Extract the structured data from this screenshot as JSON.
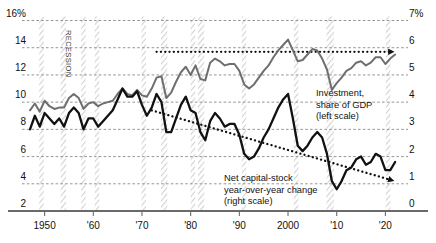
{
  "chart_data": {
    "type": "line",
    "title": "",
    "xlabel": "",
    "ylabel": "",
    "x_ticks": [
      "1950",
      "'60",
      "'70",
      "'80",
      "'90",
      "2000",
      "'10",
      "'20"
    ],
    "x_tick_years": [
      1950,
      1960,
      1970,
      1980,
      1990,
      2000,
      2010,
      2020
    ],
    "xlim": [
      1947,
      2023
    ],
    "left_axis": {
      "label": "16%",
      "unit": "%",
      "ticks": [
        "2",
        "4",
        "6",
        "8",
        "10",
        "12",
        "14",
        "16%"
      ],
      "tick_values": [
        2,
        4,
        6,
        8,
        10,
        12,
        14,
        16
      ],
      "ylim": [
        2,
        16
      ],
      "scale_note": "left scale"
    },
    "right_axis": {
      "label": "7%",
      "unit": "%",
      "ticks": [
        "0",
        "1",
        "2",
        "3",
        "4",
        "5",
        "6",
        "7%"
      ],
      "tick_values": [
        0,
        1,
        2,
        3,
        4,
        5,
        6,
        7
      ],
      "ylim": [
        0,
        7
      ],
      "scale_note": "right scale"
    },
    "grid": true,
    "legend_position": "inline-annotations",
    "series": [
      {
        "name": "Investment, share of GDP",
        "axis": "left",
        "color": "#6e6e6e",
        "style": "solid",
        "x": [
          1947,
          1948,
          1949,
          1950,
          1951,
          1952,
          1953,
          1954,
          1955,
          1956,
          1957,
          1958,
          1959,
          1960,
          1961,
          1962,
          1963,
          1964,
          1965,
          1966,
          1967,
          1968,
          1969,
          1970,
          1971,
          1972,
          1973,
          1974,
          1975,
          1976,
          1977,
          1978,
          1979,
          1980,
          1981,
          1982,
          1983,
          1984,
          1985,
          1986,
          1987,
          1988,
          1989,
          1990,
          1991,
          1992,
          1993,
          1994,
          1995,
          1996,
          1997,
          1998,
          1999,
          2000,
          2001,
          2002,
          2003,
          2004,
          2005,
          2006,
          2007,
          2008,
          2009,
          2010,
          2011,
          2012,
          2013,
          2014,
          2015,
          2016,
          2017,
          2018,
          2019,
          2020,
          2021,
          2022
        ],
        "values": [
          9.4,
          9.9,
          9.3,
          10.1,
          9.7,
          9.5,
          9.6,
          9.6,
          10.3,
          10.6,
          10.3,
          9.5,
          9.9,
          10.0,
          9.7,
          9.9,
          10.0,
          10.1,
          10.6,
          11.0,
          10.6,
          10.5,
          10.9,
          10.5,
          10.4,
          11.0,
          11.8,
          11.9,
          10.3,
          10.7,
          11.5,
          12.2,
          12.6,
          12.0,
          12.7,
          11.7,
          11.6,
          12.9,
          13.2,
          13.0,
          12.7,
          12.8,
          12.8,
          12.3,
          11.3,
          11.0,
          11.3,
          11.8,
          12.3,
          12.7,
          13.3,
          13.8,
          14.2,
          14.6,
          13.8,
          13.0,
          13.1,
          13.5,
          13.9,
          13.8,
          13.2,
          12.4,
          10.9,
          11.4,
          11.8,
          12.3,
          12.5,
          12.9,
          13.0,
          12.7,
          12.9,
          13.3,
          13.3,
          12.8,
          13.2,
          13.5
        ]
      },
      {
        "name": "Net capital-stock year-over-year change",
        "axis": "right",
        "color": "#111111",
        "style": "solid",
        "x": [
          1947,
          1948,
          1949,
          1950,
          1951,
          1952,
          1953,
          1954,
          1955,
          1956,
          1957,
          1958,
          1959,
          1960,
          1961,
          1962,
          1963,
          1964,
          1965,
          1966,
          1967,
          1968,
          1969,
          1970,
          1971,
          1972,
          1973,
          1974,
          1975,
          1976,
          1977,
          1978,
          1979,
          1980,
          1981,
          1982,
          1983,
          1984,
          1985,
          1986,
          1987,
          1988,
          1989,
          1990,
          1991,
          1992,
          1993,
          1994,
          1995,
          1996,
          1997,
          1998,
          1999,
          2000,
          2001,
          2002,
          2003,
          2004,
          2005,
          2006,
          2007,
          2008,
          2009,
          2010,
          2011,
          2012,
          2013,
          2014,
          2015,
          2016,
          2017,
          2018,
          2019,
          2020,
          2021,
          2022
        ],
        "values": [
          3.0,
          3.5,
          3.1,
          3.6,
          3.4,
          3.2,
          3.4,
          3.1,
          3.6,
          3.8,
          3.6,
          3.0,
          3.4,
          3.4,
          3.1,
          3.3,
          3.5,
          3.7,
          4.1,
          4.5,
          4.2,
          4.2,
          4.4,
          3.9,
          3.5,
          3.8,
          4.3,
          4.0,
          2.9,
          2.9,
          3.4,
          3.9,
          4.2,
          3.7,
          3.6,
          2.9,
          2.6,
          3.3,
          3.6,
          3.4,
          3.1,
          3.2,
          3.2,
          2.8,
          2.1,
          1.9,
          2.0,
          2.3,
          2.7,
          3.0,
          3.4,
          3.8,
          4.1,
          4.3,
          3.4,
          2.4,
          2.2,
          2.4,
          2.7,
          2.9,
          2.7,
          2.1,
          1.1,
          0.8,
          1.1,
          1.5,
          1.6,
          1.9,
          2.0,
          1.7,
          1.8,
          2.1,
          2.0,
          1.5,
          1.5,
          1.8
        ]
      }
    ],
    "trend_annotations": [
      {
        "name": "investment-trend-arrow",
        "axis": "left",
        "style": "dotted-arrow",
        "from": {
          "year": 1973,
          "value": 13.7
        },
        "to": {
          "year": 2022,
          "value": 13.7
        },
        "direction": "flat"
      },
      {
        "name": "netcap-trend-arrow",
        "axis": "right",
        "style": "dotted-arrow",
        "from": {
          "year": 1972,
          "value": 3.7
        },
        "to": {
          "year": 2022,
          "value": 1.15
        },
        "direction": "declining"
      }
    ],
    "recession_bands": [
      {
        "start": 1948.9,
        "end": 1949.8
      },
      {
        "start": 1953.3,
        "end": 1954.4
      },
      {
        "start": 1957.5,
        "end": 1958.3
      },
      {
        "start": 1960.3,
        "end": 1961.1
      },
      {
        "start": 1969.9,
        "end": 1970.8
      },
      {
        "start": 1973.9,
        "end": 1975.2
      },
      {
        "start": 1980.0,
        "end": 1980.5
      },
      {
        "start": 1981.5,
        "end": 1982.8
      },
      {
        "start": 1990.5,
        "end": 1991.2
      },
      {
        "start": 2001.2,
        "end": 2001.9
      },
      {
        "start": 2007.9,
        "end": 2009.4
      },
      {
        "start": 2020.1,
        "end": 2020.5
      }
    ]
  },
  "labels": {
    "recession_band_label": "RECESSION",
    "investment_annotation": [
      "Investment,",
      "share of GDP",
      "(left scale)"
    ],
    "netcap_annotation": [
      "Net capital-stock",
      "year-over-year change",
      "(right scale)"
    ]
  },
  "colors": {
    "investment_line": "#6e6e6e",
    "netcap_line": "#111111",
    "axis": "#555555",
    "gridline": "#8a8a8a",
    "recession_band": "#d8d8d8",
    "background": "#ffffff",
    "text": "#111111"
  }
}
